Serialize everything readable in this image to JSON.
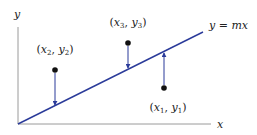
{
  "diagram": {
    "title": "",
    "axes": {
      "x_label": "x",
      "y_label": "y",
      "origin": [
        18,
        124
      ],
      "x_end": [
        211,
        124
      ],
      "y_end": [
        18,
        27
      ],
      "color": "#9a9a9a"
    },
    "fit_line": {
      "label": "y = mx",
      "label_parts": {
        "lhs": "y",
        "eq": " = ",
        "rhs": "mx"
      },
      "start": [
        18,
        124
      ],
      "end": [
        203,
        32
      ],
      "color": "#2b3b9a"
    },
    "points": [
      {
        "id": "p1",
        "label": "(x1, y1)",
        "label_parts": {
          "x": "x",
          "xsub": "1",
          "y": "y",
          "ysub": "1"
        },
        "pos": [
          164,
          88
        ],
        "line_y": 52,
        "direction": "up",
        "label_pos": [
          168,
          111
        ]
      },
      {
        "id": "p2",
        "label": "(x2, y2)",
        "label_parts": {
          "x": "x",
          "xsub": "2",
          "y": "y",
          "ysub": "2"
        },
        "pos": [
          55,
          70
        ],
        "line_y": 106,
        "direction": "down",
        "label_pos": [
          55,
          53
        ]
      },
      {
        "id": "p3",
        "label": "(x3, y3)",
        "label_parts": {
          "x": "x",
          "xsub": "3",
          "y": "y",
          "ysub": "3"
        },
        "pos": [
          128,
          43
        ],
        "line_y": 69,
        "direction": "down",
        "label_pos": [
          128,
          26
        ]
      }
    ],
    "point_color": "#111111",
    "residual_color": "#2b3b9a"
  }
}
